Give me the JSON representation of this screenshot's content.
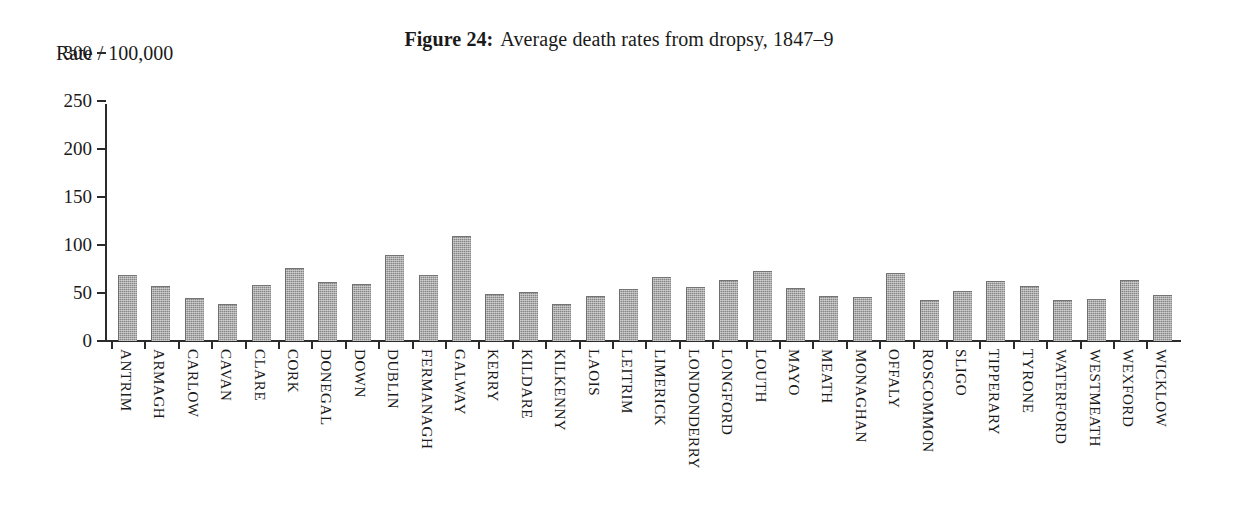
{
  "figure": {
    "label": "Figure 24:",
    "caption": "Average death rates from dropsy, 1847–9",
    "y_axis_caption": "Rate / 100,000"
  },
  "chart_data": {
    "type": "bar",
    "xlabel": "",
    "ylabel": "Rate / 100,000",
    "ylim": [
      0,
      300
    ],
    "yticks": [
      0,
      50,
      100,
      150,
      200,
      250,
      300
    ],
    "ytick_labels": [
      "0",
      "50",
      "100",
      "150",
      "200",
      "250",
      "300"
    ],
    "grid": false,
    "legend": null,
    "bar_color": "#878787",
    "categories": [
      "ANTRIM",
      "ARMAGH",
      "CARLOW",
      "CAVAN",
      "CLARE",
      "CORK",
      "DONEGAL",
      "DOWN",
      "DUBLIN",
      "FERMANAGH",
      "GALWAY",
      "KERRY",
      "KILDARE",
      "KILKENNY",
      "LAOIS",
      "LEITRIM",
      "LIMERICK",
      "LONDONDERRY",
      "LONGFORD",
      "LOUTH",
      "MAYO",
      "MEATH",
      "MONAGHAN",
      "OFFALY",
      "ROSCOMMON",
      "SLIGO",
      "TIPPERARY",
      "TYRONE",
      "WATERFORD",
      "WESTMEATH",
      "WEXFORD",
      "WICKLOW"
    ],
    "values": [
      68,
      56,
      44,
      38,
      57,
      75,
      60,
      58,
      89,
      68,
      108,
      48,
      50,
      37,
      46,
      53,
      66,
      55,
      62,
      72,
      54,
      46,
      45,
      70,
      42,
      51,
      61,
      56,
      42,
      43,
      63,
      47
    ]
  }
}
